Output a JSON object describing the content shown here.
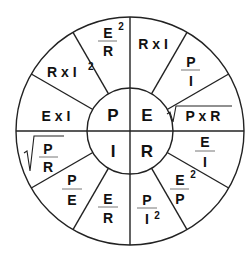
{
  "diagram": {
    "colors": {
      "line": "#222222",
      "text": "#111111",
      "background": "#ffffff"
    },
    "center": {
      "P": "P",
      "E": "E",
      "I": "I",
      "R": "R"
    },
    "segments": {
      "P": [
        {
          "id": "p-e2-over-r",
          "num": "E",
          "sup": "2",
          "den": "R"
        },
        {
          "id": "p-r-x-i2",
          "text": "R x I",
          "sup": "2"
        },
        {
          "id": "p-e-x-i",
          "text": "E x I"
        }
      ],
      "E": [
        {
          "id": "e-r-x-i",
          "text": "R x I"
        },
        {
          "id": "e-p-over-i",
          "num": "P",
          "den": "I"
        },
        {
          "id": "e-sqrt-p-x-r",
          "sqrt": "√",
          "text": "P x R"
        }
      ],
      "R": [
        {
          "id": "r-e-over-i",
          "num": "E",
          "den": "I"
        },
        {
          "id": "r-e2-over-p",
          "num": "E",
          "sup": "2",
          "den": "P"
        },
        {
          "id": "r-p-over-i2",
          "num": "P",
          "den": "I",
          "densup": "2"
        }
      ],
      "I": [
        {
          "id": "i-e-over-r",
          "num": "E",
          "den": "R"
        },
        {
          "id": "i-p-over-e",
          "num": "P",
          "den": "E"
        },
        {
          "id": "i-sqrt-p-over-r",
          "sqrt": "√",
          "num": "P",
          "den": "R"
        }
      ]
    }
  }
}
